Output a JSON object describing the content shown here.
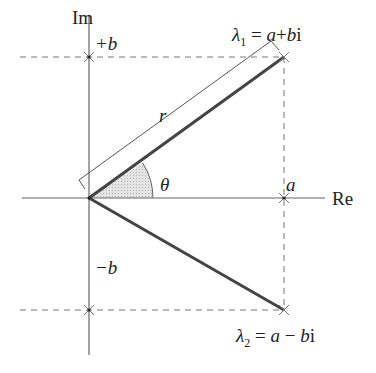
{
  "diagram": {
    "axes": {
      "imag_label": "Im",
      "real_label": "Re"
    },
    "ticks": {
      "plus_b": "+b",
      "minus_b": "−b",
      "a": "a"
    },
    "angle_label": "θ",
    "radius_label": "r",
    "eigen1": {
      "sym": "λ",
      "sub": "1",
      "eq": " = ",
      "expr_a": "a",
      "op": "+",
      "expr_b": "b",
      "i": "i"
    },
    "eigen2": {
      "sym": "λ",
      "sub": "2",
      "eq": " = ",
      "expr_a": "a",
      "op": " − ",
      "expr_b": "b",
      "i": "i"
    },
    "colors": {
      "axis": "#555555",
      "vector": "#444444",
      "dashed": "#666666",
      "shade": "#d8d8d8"
    }
  }
}
